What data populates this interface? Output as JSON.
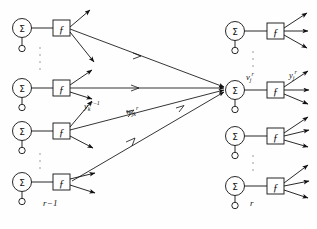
{
  "figure": {
    "type": "neural-network-diagram",
    "node_symbol": "Σ",
    "activation_symbol": "ƒ"
  },
  "layers": [
    {
      "id": "left",
      "label": "r−1",
      "label_x": 48,
      "label_y": 205,
      "neuron_count_shown": 4,
      "neurons": [
        {
          "index": 0,
          "sum_x": 22,
          "sum_y": 28,
          "box_x": 58,
          "box_y": 28,
          "out_arrows": 2
        },
        {
          "index": 1,
          "sum_x": 22,
          "sum_y": 88,
          "box_x": 58,
          "box_y": 88,
          "out_arrows": 3
        },
        {
          "index": 2,
          "sum_x": 22,
          "sum_y": 131,
          "box_x": 58,
          "box_y": 131,
          "out_arrows": 2
        },
        {
          "index": 3,
          "sum_x": 22,
          "sum_y": 182,
          "box_x": 58,
          "box_y": 182,
          "out_arrows": 2
        }
      ],
      "ellipsis": [
        {
          "x": 40,
          "y_top": 44,
          "y_bottom": 72
        },
        {
          "x": 40,
          "y_top": 150,
          "y_bottom": 172
        }
      ]
    },
    {
      "id": "right",
      "label": "r",
      "label_x": 252,
      "label_y": 205,
      "neuron_count_shown": 4,
      "neurons": [
        {
          "index": 0,
          "sum_x": 235,
          "sum_y": 31,
          "box_x": 272,
          "box_y": 31,
          "out_arrows": 3
        },
        {
          "index": 1,
          "sum_x": 235,
          "sum_y": 90,
          "box_x": 272,
          "box_y": 90,
          "out_arrows": 3,
          "highlight": true
        },
        {
          "index": 2,
          "sum_x": 235,
          "sum_y": 136,
          "box_x": 272,
          "box_y": 136,
          "out_arrows": 3
        },
        {
          "index": 3,
          "sum_x": 235,
          "sum_y": 186,
          "box_x": 272,
          "box_y": 186,
          "out_arrows": 3
        }
      ],
      "ellipsis": [
        {
          "x": 253,
          "y_top": 48,
          "y_bottom": 72
        },
        {
          "x": 253,
          "y_top": 152,
          "y_bottom": 176
        }
      ]
    }
  ],
  "labels": {
    "activation_in": {
      "base": "y",
      "sub": "k",
      "sup": "r−1",
      "text": "y",
      "x": 84,
      "y": 106,
      "meaning": "output of neuron k in layer r-1"
    },
    "weight": {
      "base": "w",
      "sub": "jk",
      "sup": "r",
      "text": "w",
      "x": 127,
      "y": 110,
      "meaning": "weight from neuron k of layer r-1 to neuron j of layer r"
    },
    "induced_field": {
      "base": "v",
      "sub": "j",
      "sup": "r",
      "text": "v",
      "x": 245,
      "y": 76,
      "meaning": "induced local field of neuron j in layer r"
    },
    "activation_out": {
      "base": "y",
      "sub": "j",
      "sup": "r",
      "text": "y",
      "x": 288,
      "y": 74,
      "meaning": "output of neuron j in layer r"
    }
  },
  "converging_edges": [
    {
      "from_neuron": 0,
      "note": "from top-left f box to central sigma"
    },
    {
      "from_neuron": 1,
      "note": "from second-left f box to central sigma"
    },
    {
      "from_neuron": 2,
      "note": "from third-left f box to central sigma"
    },
    {
      "from_neuron": 3,
      "note": "from bottom-left f box to central sigma"
    }
  ]
}
